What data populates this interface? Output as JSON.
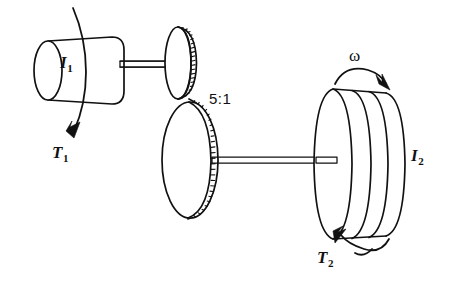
{
  "figure": {
    "kind": "engineering-schematic",
    "background_color": "#ffffff",
    "line_color": "#111111"
  },
  "labels": {
    "rotor1_symbol": "I",
    "rotor1_subscript": "1",
    "torque1_symbol": "T",
    "torque1_subscript": "1",
    "gear_ratio": "5:1",
    "angular_velocity_symbol": "ω",
    "rotor2_symbol": "I",
    "rotor2_subscript": "2",
    "torque2_symbol": "T",
    "torque2_subscript": "2"
  },
  "components": {
    "left_rotor": {
      "name": "cylindrical rotor I1",
      "center": [
        85,
        70
      ],
      "width": 78,
      "height": 68
    },
    "left_shaft": {
      "name": "input shaft",
      "from_x": 121,
      "to_x": 183,
      "y": 64
    },
    "pinion": {
      "name": "small gear (pinion)",
      "center": [
        178,
        63
      ],
      "rx": 13,
      "ry": 36,
      "teeth": 15
    },
    "gear": {
      "name": "large gear",
      "center": [
        190,
        160
      ],
      "rx": 28,
      "ry": 58,
      "teeth": 21
    },
    "mesh_point": [
      190,
      99
    ],
    "right_shaft": {
      "name": "output shaft",
      "from_x": 215,
      "to_x": 337,
      "y": 160
    },
    "right_rotor": {
      "name": "stacked disc rotor I2",
      "center": [
        358,
        164
      ],
      "disc_count": 4
    }
  },
  "arrows": {
    "torque1": {
      "name": "T1 torque arrow",
      "direction": "clockwise-wrap-down-left"
    },
    "omega": {
      "name": "angular velocity arrow",
      "direction": "up-right"
    },
    "torque2": {
      "name": "T2 torque arrow",
      "direction": "down-left"
    }
  }
}
